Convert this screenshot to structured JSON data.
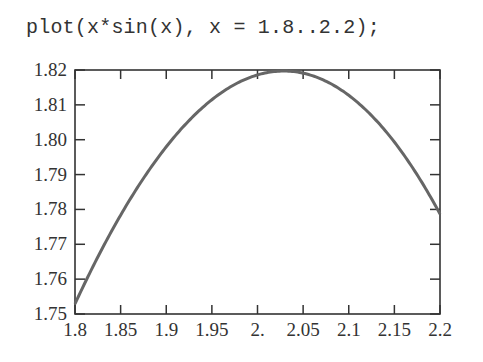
{
  "command": "plot(x*sin(x), x = 1.8..2.2);",
  "colors": {
    "curve": "#666666",
    "axis": "#333333",
    "text": "#333333",
    "background": "#ffffff"
  },
  "chart_data": {
    "type": "line",
    "title": "",
    "xlabel": "",
    "ylabel": "",
    "function": "x*sin(x)",
    "xlim": [
      1.8,
      2.2
    ],
    "ylim": [
      1.75,
      1.82
    ],
    "grid": false,
    "legend": null,
    "x_ticks": [
      "1.8",
      "1.85",
      "1.9",
      "1.95",
      "2.",
      "2.05",
      "2.1",
      "2.15",
      "2.2"
    ],
    "y_ticks": [
      "1.75",
      "1.76",
      "1.77",
      "1.78",
      "1.79",
      "1.80",
      "1.81",
      "1.82"
    ],
    "series": [
      {
        "name": "x*sin(x)",
        "x": [
          1.8,
          1.85,
          1.9,
          1.95,
          2.0,
          2.05,
          2.1,
          2.15,
          2.2
        ],
        "y": [
          1.7531,
          1.7744,
          1.7931,
          1.8069,
          1.8186,
          1.8179,
          1.8128,
          1.7982,
          1.7783
        ]
      }
    ]
  }
}
